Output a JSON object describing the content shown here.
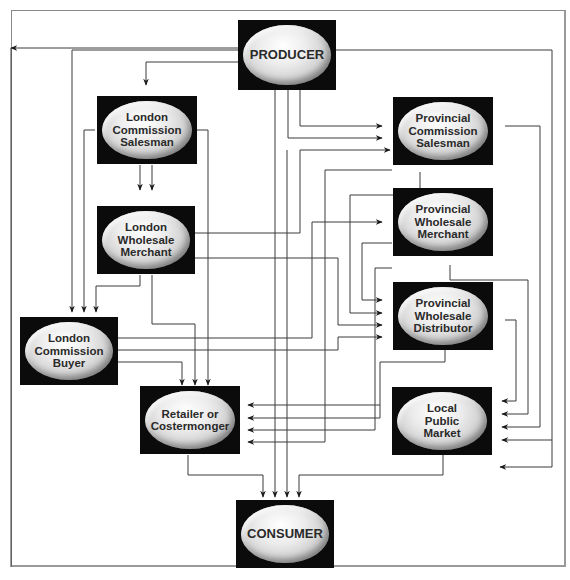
{
  "diagram": {
    "type": "flow-diagram",
    "nodes": {
      "producer": {
        "label": "PRODUCER"
      },
      "london_commission_salesman": {
        "label": "London\nCommission\nSalesman"
      },
      "provincial_commission_salesman": {
        "label": "Provincial\nCommission\nSalesman"
      },
      "london_wholesale_merchant": {
        "label": "London\nWholesale\nMerchant"
      },
      "provincial_wholesale_merchant": {
        "label": "Provincial\nWholesale\nMerchant"
      },
      "provincial_wholesale_distributor": {
        "label": "Provincial\nWholesale\nDistributor"
      },
      "london_commission_buyer": {
        "label": "London\nCommission\nBuyer"
      },
      "retailer_or_costermonger": {
        "label": "Retailer or\nCostermonger"
      },
      "local_public_market": {
        "label": "Local\nPublic\nMarket"
      },
      "consumer": {
        "label": "CONSUMER"
      }
    },
    "edges": [
      [
        "producer",
        "london_commission_salesman"
      ],
      [
        "producer",
        "london_commission_buyer"
      ],
      [
        "producer",
        "provincial_commission_salesman"
      ],
      [
        "producer",
        "retailer_or_costermonger"
      ],
      [
        "producer",
        "local_public_market"
      ],
      [
        "producer",
        "consumer"
      ],
      [
        "london_commission_salesman",
        "london_wholesale_merchant"
      ],
      [
        "london_commission_salesman",
        "london_commission_buyer"
      ],
      [
        "london_commission_salesman",
        "retailer_or_costermonger"
      ],
      [
        "london_wholesale_merchant",
        "london_commission_buyer"
      ],
      [
        "london_wholesale_merchant",
        "retailer_or_costermonger"
      ],
      [
        "london_wholesale_merchant",
        "provincial_commission_salesman"
      ],
      [
        "london_wholesale_merchant",
        "provincial_wholesale_distributor"
      ],
      [
        "london_commission_buyer",
        "provincial_wholesale_merchant"
      ],
      [
        "london_commission_buyer",
        "provincial_wholesale_distributor"
      ],
      [
        "london_commission_buyer",
        "retailer_or_costermonger"
      ],
      [
        "provincial_commission_salesman",
        "provincial_wholesale_distributor"
      ],
      [
        "provincial_commission_salesman",
        "retailer_or_costermonger"
      ],
      [
        "provincial_commission_salesman",
        "local_public_market"
      ],
      [
        "provincial_wholesale_merchant",
        "provincial_wholesale_distributor"
      ],
      [
        "provincial_wholesale_merchant",
        "retailer_or_costermonger"
      ],
      [
        "provincial_wholesale_merchant",
        "local_public_market"
      ],
      [
        "provincial_wholesale_distributor",
        "retailer_or_costermonger"
      ],
      [
        "provincial_wholesale_distributor",
        "local_public_market"
      ],
      [
        "retailer_or_costermonger",
        "consumer"
      ],
      [
        "local_public_market",
        "consumer"
      ]
    ],
    "colors": {
      "node_box": "#0b0b0b",
      "ellipse": "#d4d4d4",
      "line": "#3a3a3a",
      "frame": "#8a8a8a"
    }
  }
}
